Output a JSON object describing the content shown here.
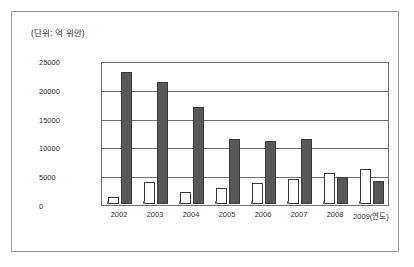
{
  "figure": {
    "unit_caption": "(단위: 억 위안)"
  },
  "chart_data": {
    "type": "bar",
    "title": "",
    "subtitle": "",
    "unit_note": "(단위: 억 위안)",
    "xlabel": "(연도)",
    "ylabel": "",
    "categories": [
      "2002",
      "2003",
      "2004",
      "2005",
      "2006",
      "2007",
      "2008",
      "2009"
    ],
    "x_tick_labels": [
      "2002",
      "2003",
      "2004",
      "2005",
      "2006",
      "2007",
      "2008",
      "2009(연도)"
    ],
    "y_tick_labels": [
      "0",
      "5000",
      "10000",
      "15000",
      "20000",
      "25000"
    ],
    "y_ticks": [
      0,
      5000,
      10000,
      15000,
      20000,
      25000
    ],
    "ylim": [
      0,
      25000
    ],
    "grid": true,
    "grid_axis": "y",
    "legend": "none",
    "series": [
      {
        "name": "series-white",
        "color": "#ffffff",
        "edge_color": "#3a3a3a",
        "values": [
          1200,
          3800,
          2100,
          2800,
          3700,
          4400,
          5400,
          6200
        ]
      },
      {
        "name": "series-dark",
        "color": "#585858",
        "edge_color": "#3a3a3a",
        "values": [
          23300,
          21500,
          17000,
          11500,
          11100,
          11400,
          4800,
          4000
        ]
      }
    ]
  }
}
